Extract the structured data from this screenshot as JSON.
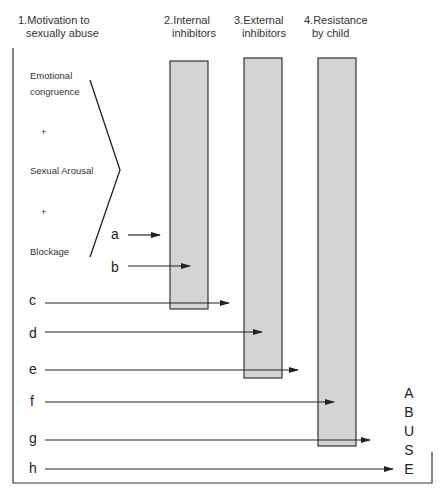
{
  "diagram": {
    "preconditions": [
      {
        "number": "1.",
        "line1": "1.Motivation to",
        "line2": "sexually abuse"
      },
      {
        "number": "2.",
        "line1": "2.Internal",
        "line2": "inhibitors"
      },
      {
        "number": "3.",
        "line1": "3.External",
        "line2": "inhibitors"
      },
      {
        "number": "4.",
        "line1": "4.Resistance",
        "line2": "by child"
      }
    ],
    "motivation_components": {
      "emotional_1": "Emotional",
      "emotional_2": "congruence",
      "plus": "+",
      "sexual_arousal": "Sexual Arousal",
      "blockage": "Blockage"
    },
    "barriers": [
      {
        "name": "Internal inhibitors",
        "color": "#d4d4d4"
      },
      {
        "name": "External inhibitors",
        "color": "#d4d4d4"
      },
      {
        "name": "Resistance by child",
        "color": "#d4d4d4"
      }
    ],
    "arrows": [
      {
        "label": "a",
        "stops_at": "before internal inhibitors"
      },
      {
        "label": "b",
        "stops_at": "internal inhibitors"
      },
      {
        "label": "c",
        "stops_at": "past internal inhibitors"
      },
      {
        "label": "d",
        "stops_at": "external inhibitors"
      },
      {
        "label": "e",
        "stops_at": "past external inhibitors"
      },
      {
        "label": "f",
        "stops_at": "resistance by child"
      },
      {
        "label": "g",
        "stops_at": "past resistance by child"
      },
      {
        "label": "h",
        "stops_at": "abuse"
      }
    ],
    "outcome_letters": [
      "A",
      "B",
      "U",
      "S",
      "E"
    ],
    "colors": {
      "bar_fill": "#d4d4d4",
      "stroke": "#222222"
    }
  }
}
